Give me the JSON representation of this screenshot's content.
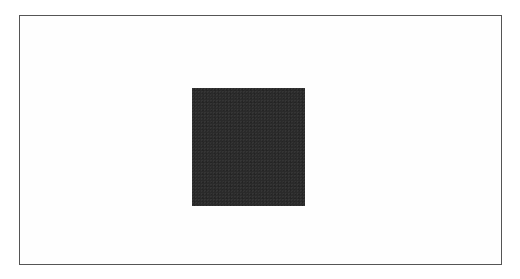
{
  "figure": {
    "frame": {
      "border_color": "#555555",
      "background": "#ffffff"
    },
    "shape": {
      "type": "square",
      "fill_color": "#2a2a2a"
    }
  }
}
